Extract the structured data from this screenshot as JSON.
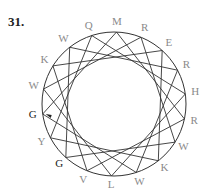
{
  "problem_number": "31.",
  "diagram": {
    "center": [
      114,
      104
    ],
    "radius": 72,
    "label_radius": 82,
    "chord_step": 5,
    "start_angle_deg": -88,
    "circle_color": "#333333",
    "label_color": "#8a8a8a",
    "highlight_color": "#222222",
    "labels": [
      {
        "text": "M",
        "highlight": false
      },
      {
        "text": "R",
        "highlight": false
      },
      {
        "text": "E",
        "highlight": false
      },
      {
        "text": "R",
        "highlight": false
      },
      {
        "text": "H",
        "highlight": false
      },
      {
        "text": "R",
        "highlight": false
      },
      {
        "text": "W",
        "highlight": false
      },
      {
        "text": "K",
        "highlight": false
      },
      {
        "text": "W",
        "highlight": false
      },
      {
        "text": "L",
        "highlight": false
      },
      {
        "text": "V",
        "highlight": false
      },
      {
        "text": "G",
        "highlight": true
      },
      {
        "text": "Y",
        "highlight": false
      },
      {
        "text": "G",
        "highlight": true
      },
      {
        "text": "W",
        "highlight": false
      },
      {
        "text": "K",
        "highlight": false
      },
      {
        "text": "W",
        "highlight": false
      },
      {
        "text": "Q",
        "highlight": false
      }
    ],
    "arrow": {
      "at_label_index": 13,
      "description": "arrow pointing to G"
    }
  }
}
